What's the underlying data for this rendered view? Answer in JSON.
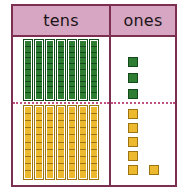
{
  "chart_data": {
    "type": "table",
    "columns": [
      "tens",
      "ones"
    ],
    "rows": [
      {
        "color_name": "green",
        "color": "#2e7d32",
        "tens_rods": 7,
        "units_per_rod": 10,
        "ones_units": 3,
        "value": 73
      },
      {
        "color_name": "yellow",
        "color": "#edb92e",
        "tens_rods": 7,
        "units_per_rod": 10,
        "ones_units": 6,
        "value": 76
      }
    ],
    "xlabel": "",
    "ylabel": "",
    "grid": true,
    "legend": "none"
  },
  "chart": {
    "header": {
      "tens_label": "tens",
      "ones_label": "ones"
    },
    "colors": {
      "border": "#7d2f52",
      "header_bg": "#d7a6c2",
      "divider": "#c0507f",
      "green_block": "#2e7d32",
      "green_block_edge": "#14491b",
      "yellow_block": "#edb92e",
      "yellow_block_edge": "#9c7512",
      "background": "#ffffff"
    }
  }
}
